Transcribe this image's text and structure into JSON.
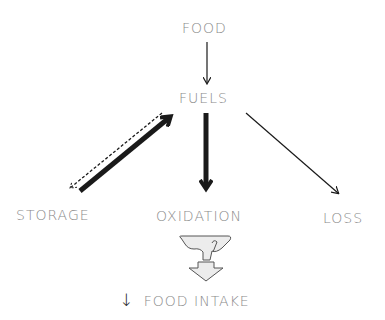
{
  "nodes": {
    "food": "FOOD",
    "fuels": "FUELS",
    "storage": "STORAGE",
    "oxidation": "OXIDATION",
    "loss": "LOSS"
  },
  "result": {
    "arrow": "↓",
    "text": "FOOD INTAKE"
  },
  "edges": [
    {
      "from": "FOOD",
      "to": "FUELS",
      "style": "thin"
    },
    {
      "from": "STORAGE",
      "to": "FUELS",
      "style": "thick"
    },
    {
      "from": "FUELS",
      "to": "STORAGE",
      "style": "dashed"
    },
    {
      "from": "FUELS",
      "to": "OXIDATION",
      "style": "thick"
    },
    {
      "from": "FUELS",
      "to": "LOSS",
      "style": "thin"
    }
  ],
  "colors": {
    "text": "#8a8a8a",
    "arrow": "#1a1a1a",
    "symbol_fill": "#e8e8e8",
    "symbol_stroke": "#555555"
  }
}
